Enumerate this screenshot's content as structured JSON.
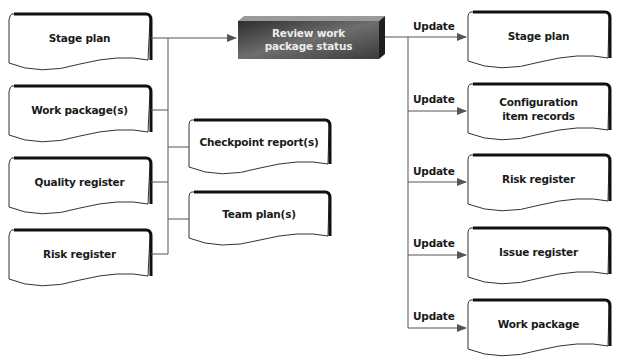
{
  "diagram": {
    "type": "process-flow",
    "central_process": {
      "label_line1": "Review work",
      "label_line2": "package status"
    },
    "inputs_left": [
      {
        "label": "Stage plan"
      },
      {
        "label": "Work package(s)"
      },
      {
        "label": "Quality register"
      },
      {
        "label": "Risk register"
      }
    ],
    "inputs_middle": [
      {
        "label": "Checkpoint report(s)"
      },
      {
        "label": "Team plan(s)"
      }
    ],
    "outputs": [
      {
        "edge_label": "Update",
        "label_line1": "Stage plan",
        "label_line2": ""
      },
      {
        "edge_label": "Update",
        "label_line1": "Configuration",
        "label_line2": "item records"
      },
      {
        "edge_label": "Update",
        "label_line1": "Risk register",
        "label_line2": ""
      },
      {
        "edge_label": "Update",
        "label_line1": "Issue register",
        "label_line2": ""
      },
      {
        "edge_label": "Update",
        "label_line1": "Work package",
        "label_line2": ""
      }
    ],
    "colors": {
      "line": "#555555",
      "doc_border": "#333333",
      "doc_shadow": "#1a1a1a",
      "central_fill_dark": "#3a3a3a",
      "central_fill_light": "#7a7a7a",
      "central_text": "#ececec"
    }
  }
}
